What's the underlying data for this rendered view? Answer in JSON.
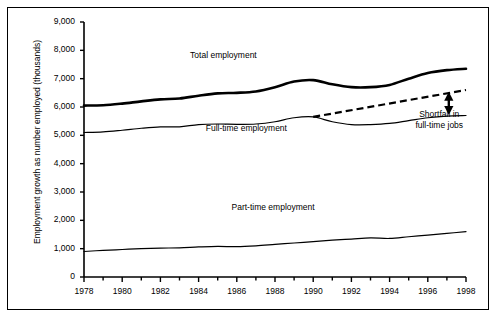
{
  "chart_data": {
    "type": "line",
    "title": "",
    "xlabel": "",
    "ylabel": "Employment growth as number employed (thousands)",
    "xlim": [
      1978,
      1998
    ],
    "ylim": [
      0,
      9000
    ],
    "grid": false,
    "legend_position": "inline-annotations",
    "y_ticks": [
      "0",
      "1,000",
      "2,000",
      "3,000",
      "4,000",
      "5,000",
      "6,000",
      "7,000",
      "8,000",
      "9,000"
    ],
    "y_tick_values": [
      0,
      1000,
      2000,
      3000,
      4000,
      5000,
      6000,
      7000,
      8000,
      9000
    ],
    "x_ticks": [
      "1978",
      "1980",
      "1982",
      "1984",
      "1986",
      "1988",
      "1990",
      "1992",
      "1994",
      "1996",
      "1998"
    ],
    "x_tick_values": [
      1978,
      1980,
      1982,
      1984,
      1986,
      1988,
      1990,
      1992,
      1994,
      1996,
      1998
    ],
    "x_minor_step": 1,
    "x": [
      1978,
      1979,
      1980,
      1981,
      1982,
      1983,
      1984,
      1985,
      1986,
      1987,
      1988,
      1989,
      1990,
      1991,
      1992,
      1993,
      1994,
      1995,
      1996,
      1997,
      1998
    ],
    "series": [
      {
        "name": "Total employment",
        "style": "solid-thick",
        "color": "#000000",
        "values": [
          6050,
          6060,
          6120,
          6200,
          6270,
          6300,
          6400,
          6480,
          6500,
          6550,
          6700,
          6900,
          6950,
          6800,
          6700,
          6700,
          6780,
          7000,
          7200,
          7300,
          7350
        ]
      },
      {
        "name": "Full-time employment",
        "style": "solid-thin",
        "color": "#000000",
        "values": [
          5100,
          5120,
          5180,
          5250,
          5300,
          5300,
          5380,
          5400,
          5390,
          5400,
          5480,
          5620,
          5650,
          5480,
          5380,
          5380,
          5420,
          5520,
          5620,
          5680,
          5700
        ]
      },
      {
        "name": "Part-time employment",
        "style": "solid-thin",
        "color": "#000000",
        "values": [
          900,
          940,
          970,
          1000,
          1020,
          1030,
          1060,
          1080,
          1070,
          1100,
          1150,
          1200,
          1250,
          1300,
          1340,
          1380,
          1360,
          1420,
          1480,
          1540,
          1600
        ]
      }
    ],
    "trend_line": {
      "name": "Full-time employment trend",
      "style": "dashed",
      "color": "#000000",
      "x": [
        1990,
        1998
      ],
      "values": [
        5650,
        6600
      ]
    },
    "annotations": [
      {
        "name": "total-employment-label",
        "text": "Total employment",
        "x": 1985.3,
        "y": 7850
      },
      {
        "name": "full-time-employment-label",
        "text": "Full-time employment",
        "x": 1986.5,
        "y": 5250
      },
      {
        "name": "part-time-employment-label",
        "text": "Part-time employment",
        "x": 1987.9,
        "y": 2480
      },
      {
        "name": "shortfall-label-line1",
        "text": "Shortfall in",
        "x": 1996.6,
        "y": 5750
      },
      {
        "name": "shortfall-label-line2",
        "text": "full-time jobs",
        "x": 1996.6,
        "y": 5380
      }
    ],
    "shortfall_arrow": {
      "name": "shortfall-double-arrow",
      "x": 1997.1,
      "y_top": 6540,
      "y_bottom": 5720,
      "heads": "both"
    }
  }
}
